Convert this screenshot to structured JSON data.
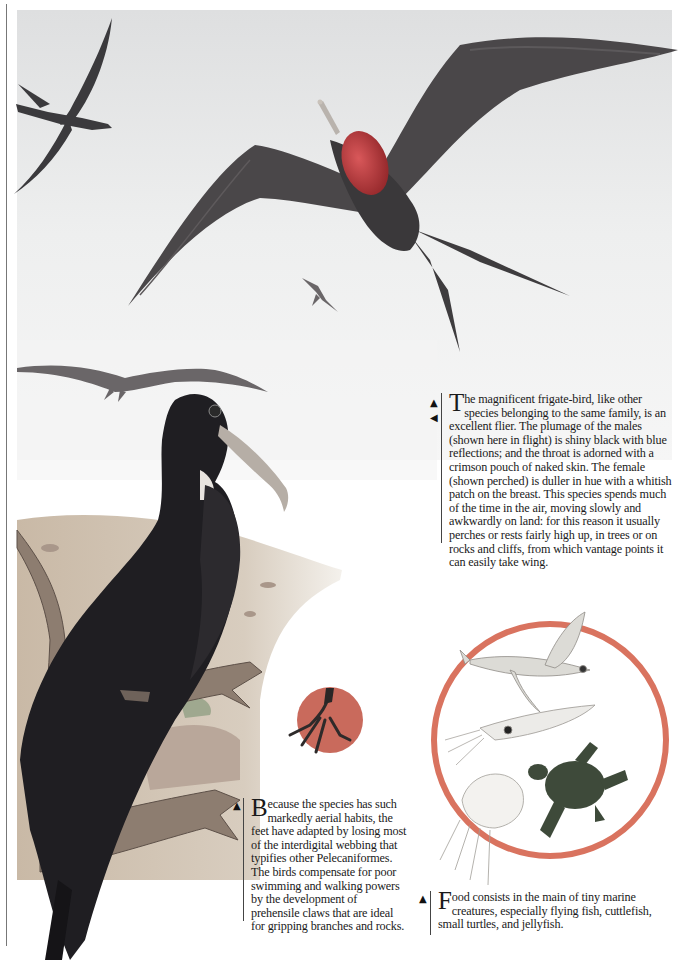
{
  "page": {
    "captions": {
      "frigate_intro": {
        "dropcap": "T",
        "text": "he magnificent frigate-bird, like other species belonging to the same family, is an excellent flier. The plumage of the males (shown here in flight) is shiny black with blue reflections; and the throat is adorned with a crimson pouch of naked skin. The female (shown perched) is duller in hue with a whitish patch on the breast. This species spends much of the time in the air, moving slowly and awkwardly on land: for this reason it usually perches or rests fairly high up, in trees or on rocks and cliffs, from which vantage points it can easily take wing.",
        "markers": [
          "up-arrow",
          "left-arrow"
        ]
      },
      "feet": {
        "dropcap": "B",
        "text": "ecause the species has such markedly aerial habits, the feet have adapted by losing most of the interdigital webbing that typifies other Pelecaniformes. The birds compensate for poor swimming and walking powers by the development of prehensile claws that are ideal for gripping branches and rocks.",
        "markers": [
          "up-arrow"
        ]
      },
      "food": {
        "dropcap": "F",
        "text": "ood consists in the main of tiny marine creatures, especially flying fish, cuttlefish, small turtles, and jellyfish.",
        "markers": [
          "up-arrow"
        ]
      }
    },
    "markers": {
      "up_arrow": "▲",
      "left_arrow": "◀"
    },
    "illustrations": {
      "sky_scene": "male frigate-birds in flight with red throat pouch",
      "perched_female": "female frigate-bird perched on branch",
      "foot_inset": "frigate-bird foot with prehensile claws",
      "food_inset": [
        "flying fish",
        "cuttlefish",
        "small turtle",
        "jellyfish"
      ]
    },
    "colors": {
      "sky": "#e9eaea",
      "bird_dark": "#2b2a2c",
      "bird_mid": "#4a4648",
      "pouch": "#b8373a",
      "food_ring": "#d9735f",
      "foot_disc": "#c96a5c",
      "turtle": "#3e4a3a",
      "ground": "#cdbfae"
    }
  }
}
